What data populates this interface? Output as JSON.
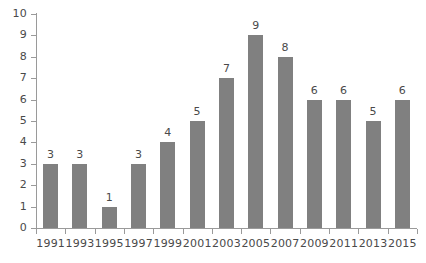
{
  "chart_data": {
    "type": "bar",
    "title": "",
    "subtitle": "",
    "xlabel": "",
    "ylabel": "",
    "categories": [
      "1991",
      "1993",
      "1995",
      "1997",
      "1999",
      "2001",
      "2003",
      "2005",
      "2007",
      "2009",
      "2011",
      "2013",
      "2015"
    ],
    "values": [
      3,
      3,
      1,
      3,
      4,
      5,
      7,
      9,
      8,
      6,
      6,
      5,
      6
    ],
    "value_labels": [
      "3",
      "3",
      "1",
      "3",
      "4",
      "5",
      "7",
      "9",
      "8",
      "6",
      "6",
      "5",
      "6"
    ],
    "ylim": [
      0,
      10
    ],
    "ytick_labels": [
      "0",
      "1",
      "2",
      "3",
      "4",
      "5",
      "6",
      "7",
      "8",
      "9",
      "10"
    ],
    "ytick_values": [
      0,
      1,
      2,
      3,
      4,
      5,
      6,
      7,
      8,
      9,
      10
    ],
    "grid": false,
    "legend": false,
    "legend_position": "none",
    "colors": {
      "bar": "#808080",
      "axis": "#9a9a9a",
      "text": "#4a4a4a",
      "background": "#ffffff"
    }
  }
}
